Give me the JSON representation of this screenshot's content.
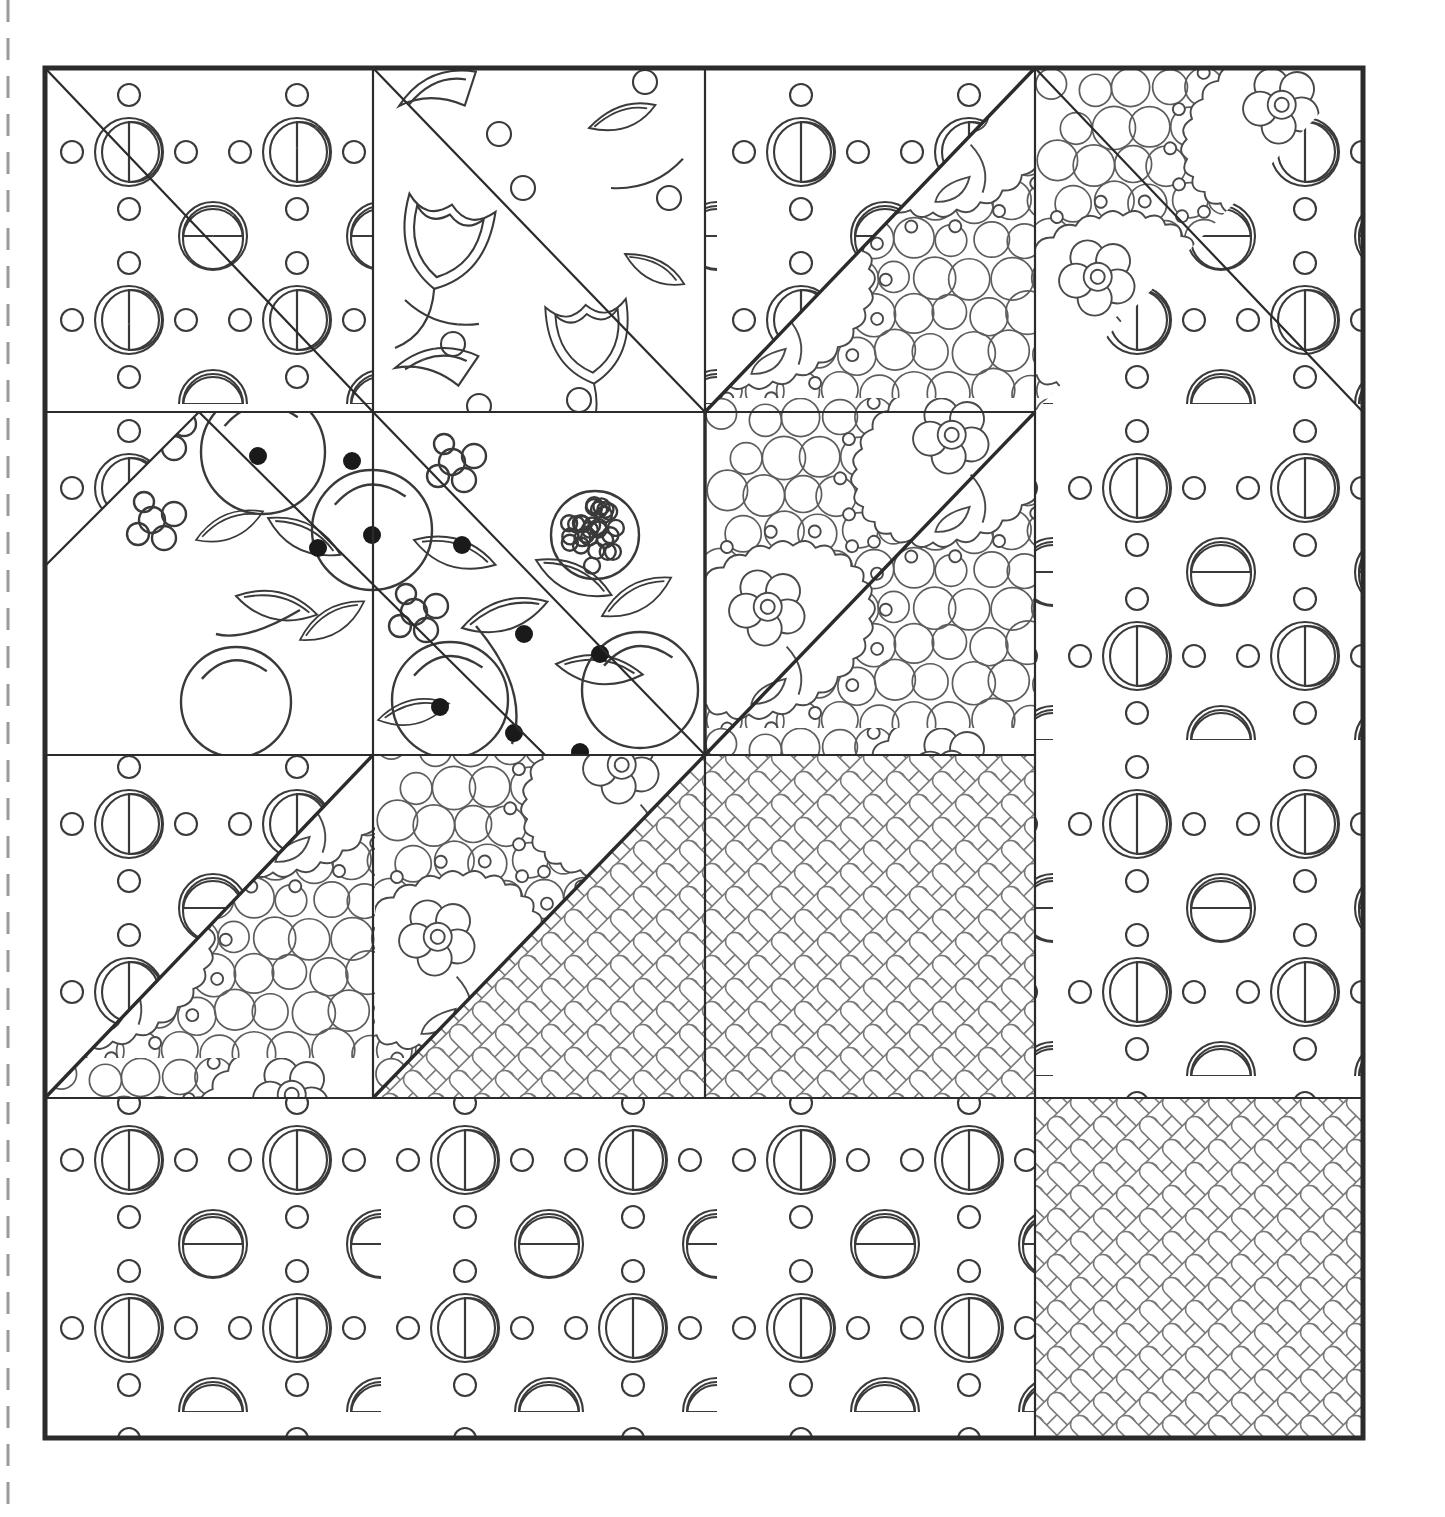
{
  "document": {
    "kind": "quilt-block-pattern-diagram",
    "title": "Maple Leaf Quilt Block Line Drawing",
    "background_color": "#ffffff",
    "ink_color": "#2b2b2b",
    "pattern_ink_color": "#6b6b6b"
  },
  "canvas": {
    "width": 1445,
    "height": 1517
  },
  "cut_line": {
    "name": "dashed-cut-line",
    "orientation": "vertical",
    "x": 8,
    "y_start": 0,
    "y_end": 1517,
    "dash": "22 16",
    "stroke_width": 3,
    "color": "#9a9a9a"
  },
  "block": {
    "name": "quilt-block-outline",
    "left": 45,
    "top": 68,
    "right": 1363,
    "bottom": 1438,
    "stroke_width": 5,
    "color": "#2b2b2b"
  },
  "grid": {
    "vertical_lines": [
      373,
      705,
      1035
    ],
    "horizontal_lines": [
      412,
      755,
      1098
    ],
    "stroke_width": 2.2
  },
  "center_point": {
    "x": 705,
    "y": 755
  },
  "fabrics": [
    {
      "id": "button",
      "label": "Button Dot Print",
      "ink": "#3a3a3a"
    },
    {
      "id": "tulip",
      "label": "Tulip Floral Print",
      "ink": "#3a3a3a"
    },
    {
      "id": "bubble",
      "label": "Bubble Dot with Scalloped Flower Print",
      "ink": "#5a5a5a"
    },
    {
      "id": "weave",
      "label": "Basketweave Capsule Print",
      "ink": "#6b6b6b"
    },
    {
      "id": "berry",
      "label": "Berry and Leaf Print",
      "ink": "#3a3a3a"
    }
  ],
  "patches": [
    {
      "name": "patch-top-left-triangle-upper",
      "fabric": "button",
      "shape": "triangle",
      "points": "45,68 373,68 45,412"
    },
    {
      "name": "patch-top-left-triangle-lower",
      "fabric": "button",
      "shape": "triangle",
      "points": "373,68 373,412 45,412"
    },
    {
      "name": "patch-top-mid-triangle-upper",
      "fabric": "tulip",
      "shape": "triangle",
      "points": "373,68 705,68 373,412"
    },
    {
      "name": "patch-top-mid-triangle-lower",
      "fabric": "tulip",
      "shape": "triangle",
      "points": "705,68 705,412 373,412"
    },
    {
      "name": "patch-top-right-leaf-stem",
      "fabric": "button",
      "shape": "polygon",
      "points": "705,68 1035,68 705,412"
    },
    {
      "name": "patch-top-right-bubble-wedge",
      "fabric": "bubble",
      "shape": "polygon",
      "points": "1035,68 1363,68 1035,412 705,412"
    },
    {
      "name": "patch-far-right-upper-button",
      "fabric": "button",
      "shape": "polygon",
      "points": "1363,68 1363,412 1035,412"
    },
    {
      "name": "patch-right-column-button",
      "fabric": "button",
      "shape": "rect",
      "points": "1035,412 1363,412 1363,1098 1035,1098"
    },
    {
      "name": "patch-mid-left-button-upper",
      "fabric": "button",
      "shape": "triangle",
      "points": "45,412 199,412 45,566"
    },
    {
      "name": "patch-mid-berry-large",
      "fabric": "berry",
      "shape": "polygon",
      "points": "199,412 705,412 705,755 45,755 45,566"
    },
    {
      "name": "patch-mid-bubble-wedge",
      "fabric": "bubble",
      "shape": "polygon",
      "points": "705,412 1035,412 1035,755 705,755"
    },
    {
      "name": "patch-lower-left-button",
      "fabric": "button",
      "shape": "polygon",
      "points": "45,755 373,755 45,1098"
    },
    {
      "name": "patch-lower-bubble-band",
      "fabric": "bubble",
      "shape": "polygon",
      "points": "373,755 705,755 373,1098 45,1098"
    },
    {
      "name": "patch-lower-weave-wedge",
      "fabric": "weave",
      "shape": "polygon",
      "points": "705,755 1035,755 1035,1098 373,1098"
    },
    {
      "name": "patch-bottom-button-band",
      "fabric": "button",
      "shape": "rect",
      "points": "45,1098 1035,1098 1035,1438 45,1438"
    },
    {
      "name": "patch-bottom-right-weave-square",
      "fabric": "weave",
      "shape": "rect",
      "points": "1035,1098 1363,1098 1363,1438 1035,1438"
    }
  ],
  "diagonals": [
    {
      "name": "diagonal-top-left-patch",
      "x1": 45,
      "y1": 68,
      "x2": 373,
      "y2": 412
    },
    {
      "name": "diagonal-top-mid-patch",
      "x1": 373,
      "y1": 68,
      "x2": 705,
      "y2": 412
    },
    {
      "name": "diagonal-leaf-left-arm",
      "x1": 705,
      "y1": 412,
      "x2": 1035,
      "y2": 68
    },
    {
      "name": "diagonal-top-right-corner",
      "x1": 1035,
      "y1": 68,
      "x2": 1363,
      "y2": 412
    },
    {
      "name": "diagonal-mid-left-small",
      "x1": 45,
      "y1": 566,
      "x2": 199,
      "y2": 412
    },
    {
      "name": "diagonal-berry-split",
      "x1": 199,
      "y1": 412,
      "x2": 545,
      "y2": 755
    },
    {
      "name": "diagonal-berry-split-b",
      "x1": 373,
      "y1": 412,
      "x2": 705,
      "y2": 755
    },
    {
      "name": "diagonal-lower-left-button",
      "x1": 45,
      "y1": 1098,
      "x2": 373,
      "y2": 755
    },
    {
      "name": "diagonal-lower-bubble",
      "x1": 373,
      "y1": 1098,
      "x2": 705,
      "y2": 755
    },
    {
      "name": "diagonal-weave-wedge",
      "x1": 705,
      "y1": 755,
      "x2": 1035,
      "y2": 412
    }
  ],
  "motifs": {
    "button_print": {
      "name": "button-motif",
      "description": "large circle with double outline and a straight chord line, surrounded by four small open dots",
      "variants": [
        "vertical-chord",
        "horizontal-chord"
      ],
      "large_radius": 33,
      "small_radius": 11,
      "tile": 168
    },
    "tulip_print": {
      "name": "tulip-motif",
      "description": "open outline tulip blossoms with curved stems and pointed leaves, scattered small open circles",
      "tile": 330
    },
    "bubble_print": {
      "name": "bubble-motif",
      "description": "densely packed open circles of varying size with scalloped oval medallions containing a five petal flower, leaf and curved stem",
      "bubble_radius": 21,
      "medallion_width": 210,
      "medallion_height": 160
    },
    "weave_print": {
      "name": "basketweave-motif",
      "description": "interlocking rounded capsules arranged in a diagonal over-under basket weave",
      "capsule_length": 46,
      "capsule_width": 17,
      "tile": 46
    },
    "berry_print": {
      "name": "berry-motif",
      "description": "round berries with highlight crescents and solid black seed dots, long pointed leaves with center vein, small berry clusters and a raspberry rosette",
      "berry_radius": 58,
      "seed_radius": 9
    }
  }
}
